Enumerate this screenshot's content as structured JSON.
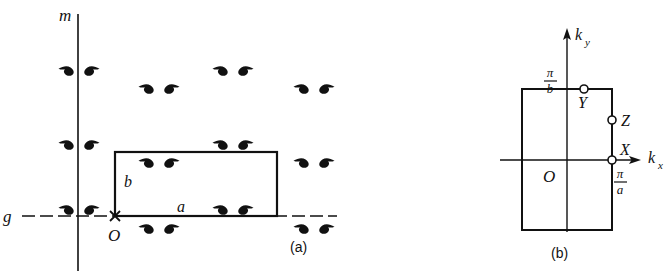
{
  "figure": {
    "domain": "crystallography-diagram",
    "ink_color": "#111111",
    "background": "#ffffff",
    "panels": [
      {
        "id": "a",
        "caption": "(a)",
        "description": "Plane group symmetry diagram with mirror line m, glide line g and rectangular unit cell",
        "labels": {
          "mirror_axis": "m",
          "glide_axis": "g",
          "origin": "O",
          "cell_edge_horizontal": "a",
          "cell_edge_vertical": "b"
        },
        "unit_cell": {
          "x": 115,
          "y": 152,
          "width": 162,
          "height": 64
        },
        "mirror_line_x": 78,
        "glide_line_y": 216,
        "motif_pairs": [
          {
            "x": 68,
            "y": 70,
            "row": "on-mirror"
          },
          {
            "x": 222,
            "y": 70,
            "row": "on-mirror"
          },
          {
            "x": 155,
            "y": 88,
            "row": "off-mirror"
          },
          {
            "x": 310,
            "y": 88,
            "row": "off-mirror"
          },
          {
            "x": 68,
            "y": 144,
            "row": "on-mirror"
          },
          {
            "x": 222,
            "y": 144,
            "row": "on-mirror"
          },
          {
            "x": 155,
            "y": 162,
            "row": "off-mirror"
          },
          {
            "x": 310,
            "y": 162,
            "row": "off-mirror"
          },
          {
            "x": 68,
            "y": 209,
            "row": "on-mirror"
          },
          {
            "x": 222,
            "y": 209,
            "row": "on-mirror"
          },
          {
            "x": 155,
            "y": 228,
            "row": "off-mirror"
          },
          {
            "x": 310,
            "y": 228,
            "row": "off-mirror"
          }
        ]
      },
      {
        "id": "b",
        "caption": "(b)",
        "description": "Brillouin zone of the rectangular lattice with symmetry points",
        "labels": {
          "axis_x": "k",
          "axis_x_sub": "x",
          "axis_y": "k",
          "axis_y_sub": "y",
          "origin": "O",
          "point_x": "X",
          "point_y": "Y",
          "point_z": "Z"
        },
        "tick_labels": {
          "ky_max_numerator": "π",
          "ky_max_denominator": "b",
          "kx_max_numerator": "π",
          "kx_max_denominator": "a"
        },
        "zone": {
          "x": 522,
          "y": 89,
          "width": 90,
          "height": 141
        },
        "axis_origin": {
          "x": 567,
          "y": 160
        },
        "symmetry_points": [
          {
            "name": "Y",
            "x": 584,
            "y": 89
          },
          {
            "name": "Z",
            "x": 612,
            "y": 120
          },
          {
            "name": "X",
            "x": 612,
            "y": 160
          }
        ]
      }
    ]
  }
}
